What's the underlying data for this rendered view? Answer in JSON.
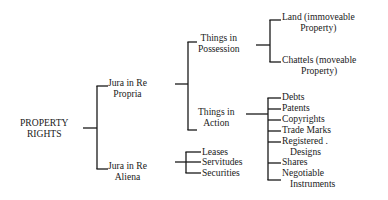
{
  "root": {
    "line1": "PROPERTY",
    "line2": "RIGHTS"
  },
  "jura_in_re_propria": {
    "line1": "Jura in Re",
    "line2": "Propria"
  },
  "jura_in_re_aliena": {
    "line1": "Jura in Re",
    "line2": "Aliena"
  },
  "things_in_possession": {
    "line1": "Things in",
    "line2": "Possession"
  },
  "things_in_action": {
    "line1": "Things in",
    "line2": "Action"
  },
  "land": {
    "line1": "Land (immoveable",
    "line2": "Property)"
  },
  "chattels": {
    "line1": "Chattels (moveable",
    "line2": "Property)"
  },
  "action_items": {
    "debts": "Debts",
    "patents": "Patents",
    "copyrights": "Copyrights",
    "trade_marks": "Trade Marks",
    "registered_designs_1": "Registered .",
    "registered_designs_2": "Designs",
    "shares": "Shares",
    "negotiable_1": "Negotiable",
    "negotiable_2": "Instruments"
  },
  "aliena_items": {
    "leases": "Leases",
    "servitudes": "Servitudes",
    "securities": "Securities"
  }
}
